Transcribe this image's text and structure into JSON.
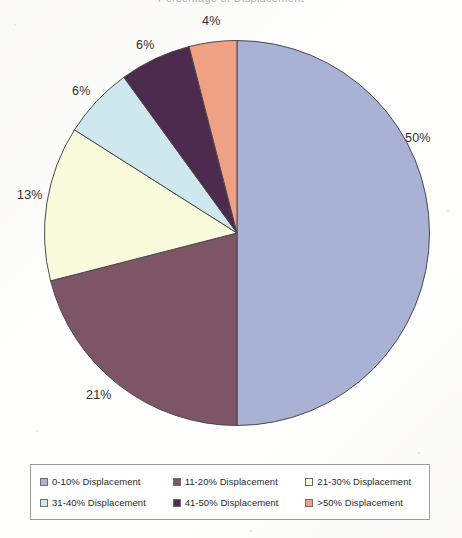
{
  "title_remnant": "Percentage of Displacement",
  "chart_data": {
    "type": "pie",
    "title": "",
    "xlabel": "",
    "ylabel": "",
    "start_angle_deg": 0,
    "direction": "clockwise",
    "legend_position": "bottom",
    "grid": false,
    "categories": [
      "0-10% Displacement",
      "11-20% Displacement",
      "21-30% Displacement",
      "31-40% Displacement",
      "41-50% Displacement",
      ">50% Displacement"
    ],
    "values": [
      50,
      21,
      13,
      6,
      6,
      4
    ],
    "data_labels": [
      "50%",
      "21%",
      "13%",
      "6%",
      "6%",
      "4%"
    ],
    "colors": [
      "#a9b1d4",
      "#7e5467",
      "#fafbdd",
      "#cfe8ef",
      "#4c2b4e",
      "#f0a183"
    ],
    "slice_border_color": "#4a4a4a"
  },
  "labels": {
    "slice_0": "50%",
    "slice_1": "21%",
    "slice_2": "13%",
    "slice_3": "6%",
    "slice_4": "6%",
    "slice_5": "4%"
  },
  "legend": {
    "items": [
      {
        "label": "0-10% Displacement",
        "color": "#a9b1d4"
      },
      {
        "label": "11-20% Displacement",
        "color": "#7e5467"
      },
      {
        "label": "21-30% Displacement",
        "color": "#fafbdd"
      },
      {
        "label": "31-40% Displacement",
        "color": "#cfe8ef"
      },
      {
        "label": "41-50% Displacement",
        "color": "#4c2b4e"
      },
      {
        "label": ">50% Displacement",
        "color": "#f0a183"
      }
    ]
  }
}
